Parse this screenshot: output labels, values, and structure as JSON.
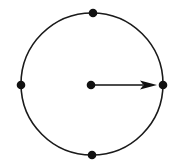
{
  "figure": {
    "background_color": "#ffffff",
    "stroke_color": "#1a1a1a",
    "dot_color": "#111111",
    "arrow_color": "#111111",
    "canvas": {
      "width": 175,
      "height": 168
    },
    "circle": {
      "center_x": 92,
      "center_y": 84,
      "radius": 71,
      "stroke_width": 1.6,
      "fill": "none"
    },
    "dots": [
      {
        "name": "center-dot",
        "label": "center",
        "x": 91,
        "y": 85,
        "r": 4.3
      },
      {
        "name": "top-dot",
        "label": "top",
        "x": 93,
        "y": 13,
        "r": 4.3
      },
      {
        "name": "right-dot",
        "label": "right",
        "x": 163,
        "y": 85,
        "r": 4.3
      },
      {
        "name": "bottom-dot",
        "label": "bottom",
        "x": 92,
        "y": 155,
        "r": 4.3
      },
      {
        "name": "left-dot",
        "label": "left",
        "x": 21,
        "y": 85,
        "r": 4.3
      }
    ],
    "arrow": {
      "label": "radius",
      "start_x": 93,
      "start_y": 85,
      "end_x": 157,
      "end_y": 85,
      "shaft_width": 1.6,
      "head_length": 17,
      "head_half_width": 4.6
    }
  }
}
